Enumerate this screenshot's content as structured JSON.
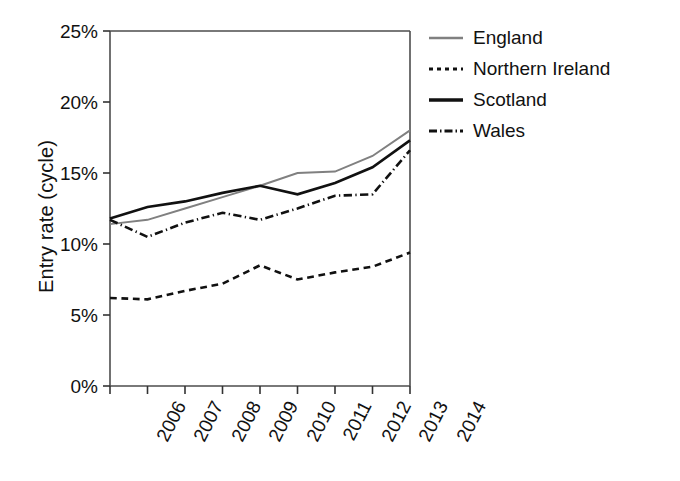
{
  "chart_data": {
    "type": "line",
    "title": "",
    "xlabel": "",
    "ylabel": "Entry rate (cycle)",
    "categories": [
      "2006",
      "2007",
      "2008",
      "2009",
      "2010",
      "2011",
      "2012",
      "2013",
      "2014"
    ],
    "x": [
      2006,
      2007,
      2008,
      2009,
      2010,
      2011,
      2012,
      2013,
      2014
    ],
    "ylim": [
      0,
      25
    ],
    "yticks": [
      0,
      5,
      10,
      15,
      20,
      25
    ],
    "ytick_labels": [
      "0%",
      "5%",
      "10%",
      "15%",
      "20%",
      "25%"
    ],
    "grid": false,
    "legend_position": "right",
    "units": "percent",
    "series": [
      {
        "name": "England",
        "style": "solid",
        "color": "#808080",
        "width": 2.0,
        "values": [
          11.4,
          11.7,
          12.5,
          13.3,
          14.1,
          15.0,
          15.1,
          16.2,
          18.0
        ]
      },
      {
        "name": "Northern Ireland",
        "style": "dashed",
        "color": "#111111",
        "width": 2.6,
        "values": [
          6.2,
          6.1,
          6.7,
          7.2,
          8.5,
          7.5,
          8.0,
          8.4,
          9.4
        ]
      },
      {
        "name": "Scotland",
        "style": "solid",
        "color": "#111111",
        "width": 2.6,
        "values": [
          11.8,
          12.6,
          13.0,
          13.6,
          14.1,
          13.5,
          14.3,
          15.4,
          17.3
        ]
      },
      {
        "name": "Wales",
        "style": "dashdot",
        "color": "#111111",
        "width": 2.6,
        "values": [
          11.7,
          10.5,
          11.5,
          12.2,
          11.7,
          12.5,
          13.4,
          13.5,
          16.6
        ]
      }
    ]
  },
  "legend": {
    "items": [
      {
        "label": "England"
      },
      {
        "label": "Northern Ireland"
      },
      {
        "label": "Scotland"
      },
      {
        "label": "Wales"
      }
    ]
  },
  "axes": {
    "frame_color": "#4d4d4d",
    "tick_color": "#333333"
  }
}
